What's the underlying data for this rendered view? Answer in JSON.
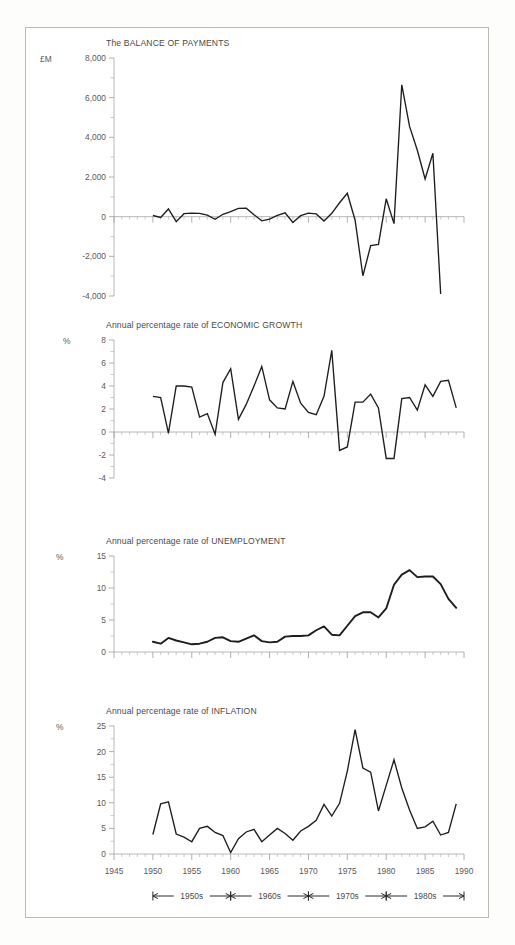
{
  "figure": {
    "background": "#fdfdfb",
    "frame_color": "#b9b9b6",
    "line_color": "#1d1d1d",
    "axis_color": "#b0b0ae"
  },
  "xaxis": {
    "ticks": [
      1945,
      1950,
      1955,
      1960,
      1965,
      1970,
      1975,
      1980,
      1985,
      1990
    ],
    "tick_labels": [
      "1945",
      "1950",
      "1955",
      "1960",
      "1965",
      "1970",
      "1975",
      "1980",
      "1985",
      "1990"
    ],
    "range": [
      1945,
      1990
    ],
    "minor_step": 1
  },
  "decade_bar": {
    "spans": [
      {
        "label": "1950s",
        "from": 1950,
        "to": 1960
      },
      {
        "label": "1960s",
        "from": 1960,
        "to": 1970
      },
      {
        "label": "1970s",
        "from": 1970,
        "to": 1980
      },
      {
        "label": "1980s",
        "from": 1980,
        "to": 1990
      }
    ]
  },
  "chart_data": [
    {
      "type": "line",
      "title": "The BALANCE OF PAYMENTS",
      "unit_label": "£M",
      "xlabel": "",
      "ylabel": "£M",
      "ylim": [
        -4000,
        8000
      ],
      "yticks": [
        -4000,
        -2000,
        0,
        2000,
        4000,
        6000,
        8000
      ],
      "ytick_labels": [
        "-4,000",
        "-2,000",
        "0",
        "2,000",
        "4,000",
        "6,000",
        "8,000"
      ],
      "yminor_step": 1000,
      "grid": false,
      "zero_line": true,
      "x": [
        1950,
        1951,
        1952,
        1953,
        1954,
        1955,
        1956,
        1957,
        1958,
        1959,
        1960,
        1961,
        1962,
        1963,
        1964,
        1965,
        1966,
        1967,
        1968,
        1969,
        1970,
        1971,
        1972,
        1973,
        1974,
        1975,
        1976,
        1977,
        1978,
        1979,
        1980,
        1981,
        1982,
        1983,
        1984,
        1985,
        1986,
        1987,
        1988,
        1989
      ],
      "values": [
        60,
        -60,
        390,
        -250,
        130,
        180,
        170,
        100,
        -120,
        100,
        250,
        420,
        430,
        100,
        -200,
        -120,
        -30,
        190,
        -250,
        150,
        -60,
        190,
        -300,
        -200,
        130,
        -70,
        -250,
        -160,
        300,
        700,
        1180,
        -200,
        -1600,
        -2980,
        -1450,
        -1400,
        -350,
        900,
        -350,
        6650,
        4600,
        3400,
        1900,
        3200,
        -3900
      ],
      "series": [
        {
          "name": "Balance of payments (£M)",
          "points": [
            [
              1950,
              60
            ],
            [
              1951,
              -40
            ],
            [
              1952,
              390
            ],
            [
              1953,
              -250
            ],
            [
              1954,
              150
            ],
            [
              1955,
              180
            ],
            [
              1956,
              170
            ],
            [
              1957,
              80
            ],
            [
              1958,
              -130
            ],
            [
              1959,
              120
            ],
            [
              1960,
              250
            ],
            [
              1961,
              420
            ],
            [
              1962,
              430
            ],
            [
              1963,
              100
            ],
            [
              1964,
              -210
            ],
            [
              1965,
              -120
            ],
            [
              1966,
              60
            ],
            [
              1967,
              190
            ],
            [
              1968,
              -290
            ],
            [
              1969,
              50
            ],
            [
              1970,
              180
            ],
            [
              1971,
              140
            ],
            [
              1972,
              -220
            ],
            [
              1973,
              170
            ],
            [
              1974,
              700
            ],
            [
              1975,
              1180
            ],
            [
              1976,
              -180
            ],
            [
              1977,
              -2980
            ],
            [
              1978,
              -1460
            ],
            [
              1979,
              -1400
            ],
            [
              1980,
              900
            ],
            [
              1981,
              -350
            ],
            [
              1982,
              6650
            ],
            [
              1983,
              4550
            ],
            [
              1984,
              3350
            ],
            [
              1985,
              1900
            ],
            [
              1986,
              3200
            ],
            [
              1987,
              -3900
            ]
          ]
        }
      ]
    },
    {
      "type": "line",
      "title": "Annual percentage rate of  ECONOMIC GROWTH",
      "unit_label": "%",
      "xlabel": "",
      "ylabel": "%",
      "ylim": [
        -4,
        8
      ],
      "yticks": [
        -4,
        -2,
        0,
        2,
        4,
        6,
        8
      ],
      "ytick_labels": [
        "-4",
        "-2",
        "0",
        "2",
        "4",
        "6",
        "8"
      ],
      "yminor_step": 1,
      "grid": false,
      "zero_line": true,
      "series": [
        {
          "name": "Economic growth (%)",
          "points": [
            [
              1950,
              3.1
            ],
            [
              1951,
              3.0
            ],
            [
              1952,
              -0.1
            ],
            [
              1953,
              4.0
            ],
            [
              1954,
              4.0
            ],
            [
              1955,
              3.9
            ],
            [
              1956,
              1.3
            ],
            [
              1957,
              1.6
            ],
            [
              1958,
              -0.2
            ],
            [
              1959,
              4.3
            ],
            [
              1960,
              5.5
            ],
            [
              1961,
              1.1
            ],
            [
              1962,
              2.4
            ],
            [
              1963,
              4.0
            ],
            [
              1964,
              5.7
            ],
            [
              1965,
              2.8
            ],
            [
              1966,
              2.1
            ],
            [
              1967,
              2.0
            ],
            [
              1968,
              4.4
            ],
            [
              1969,
              2.5
            ],
            [
              1970,
              1.7
            ],
            [
              1971,
              1.5
            ],
            [
              1972,
              3.1
            ],
            [
              1973,
              7.1
            ],
            [
              1974,
              -1.6
            ],
            [
              1975,
              -1.3
            ],
            [
              1976,
              2.6
            ],
            [
              1977,
              2.6
            ],
            [
              1978,
              3.3
            ],
            [
              1979,
              2.1
            ],
            [
              1980,
              -2.3
            ],
            [
              1981,
              -2.3
            ],
            [
              1982,
              2.9
            ],
            [
              1983,
              3.0
            ],
            [
              1984,
              1.9
            ],
            [
              1985,
              4.1
            ],
            [
              1986,
              3.1
            ],
            [
              1987,
              4.4
            ],
            [
              1988,
              4.5
            ],
            [
              1989,
              2.1
            ]
          ]
        }
      ]
    },
    {
      "type": "line",
      "title": "Annual percentage rate of UNEMPLOYMENT",
      "unit_label": "%",
      "xlabel": "",
      "ylabel": "%",
      "ylim": [
        0,
        15
      ],
      "yticks": [
        0,
        5,
        10,
        15
      ],
      "ytick_labels": [
        "0",
        "5",
        "10",
        "15"
      ],
      "yminor_step": 2.5,
      "grid": false,
      "zero_line": true,
      "series": [
        {
          "name": "Unemployment (%)",
          "points": [
            [
              1950,
              1.6
            ],
            [
              1951,
              1.3
            ],
            [
              1952,
              2.2
            ],
            [
              1953,
              1.8
            ],
            [
              1954,
              1.5
            ],
            [
              1955,
              1.2
            ],
            [
              1956,
              1.3
            ],
            [
              1957,
              1.6
            ],
            [
              1958,
              2.2
            ],
            [
              1959,
              2.3
            ],
            [
              1960,
              1.7
            ],
            [
              1961,
              1.6
            ],
            [
              1962,
              2.1
            ],
            [
              1963,
              2.6
            ],
            [
              1964,
              1.7
            ],
            [
              1965,
              1.5
            ],
            [
              1966,
              1.6
            ],
            [
              1967,
              2.4
            ],
            [
              1968,
              2.5
            ],
            [
              1969,
              2.5
            ],
            [
              1970,
              2.6
            ],
            [
              1971,
              3.4
            ],
            [
              1972,
              4.0
            ],
            [
              1973,
              2.7
            ],
            [
              1974,
              2.6
            ],
            [
              1975,
              4.1
            ],
            [
              1976,
              5.6
            ],
            [
              1977,
              6.2
            ],
            [
              1978,
              6.2
            ],
            [
              1979,
              5.4
            ],
            [
              1980,
              6.8
            ],
            [
              1981,
              10.5
            ],
            [
              1982,
              12.1
            ],
            [
              1983,
              12.8
            ],
            [
              1984,
              11.7
            ],
            [
              1985,
              11.8
            ],
            [
              1986,
              11.8
            ],
            [
              1987,
              10.6
            ],
            [
              1988,
              8.3
            ],
            [
              1989,
              6.9
            ]
          ]
        }
      ]
    },
    {
      "type": "line",
      "title": "Annual percentage rate of INFLATION",
      "unit_label": "%",
      "xlabel": "",
      "ylabel": "%",
      "ylim": [
        0,
        25
      ],
      "yticks": [
        0,
        5,
        10,
        15,
        20,
        25
      ],
      "ytick_labels": [
        "0",
        "5",
        "10",
        "15",
        "20",
        "25"
      ],
      "yminor_step": 2.5,
      "grid": false,
      "zero_line": true,
      "series": [
        {
          "name": "Inflation (%)",
          "points": [
            [
              1950,
              3.8
            ],
            [
              1951,
              9.8
            ],
            [
              1952,
              10.2
            ],
            [
              1953,
              3.9
            ],
            [
              1954,
              3.3
            ],
            [
              1955,
              2.4
            ],
            [
              1956,
              5.0
            ],
            [
              1957,
              5.4
            ],
            [
              1958,
              4.2
            ],
            [
              1959,
              3.6
            ],
            [
              1960,
              0.3
            ],
            [
              1961,
              3.0
            ],
            [
              1962,
              4.3
            ],
            [
              1963,
              4.8
            ],
            [
              1964,
              2.4
            ],
            [
              1965,
              3.7
            ],
            [
              1966,
              5.0
            ],
            [
              1967,
              4.0
            ],
            [
              1968,
              2.7
            ],
            [
              1969,
              4.5
            ],
            [
              1970,
              5.4
            ],
            [
              1971,
              6.6
            ],
            [
              1972,
              9.7
            ],
            [
              1973,
              7.4
            ],
            [
              1974,
              9.9
            ],
            [
              1975,
              16.2
            ],
            [
              1976,
              24.3
            ],
            [
              1977,
              16.8
            ],
            [
              1978,
              16.0
            ],
            [
              1979,
              8.4
            ],
            [
              1980,
              13.4
            ],
            [
              1981,
              18.4
            ],
            [
              1982,
              12.9
            ],
            [
              1983,
              8.6
            ],
            [
              1984,
              5.0
            ],
            [
              1985,
              5.3
            ],
            [
              1986,
              6.4
            ],
            [
              1987,
              3.7
            ],
            [
              1988,
              4.2
            ],
            [
              1989,
              9.8
            ]
          ]
        }
      ]
    }
  ]
}
